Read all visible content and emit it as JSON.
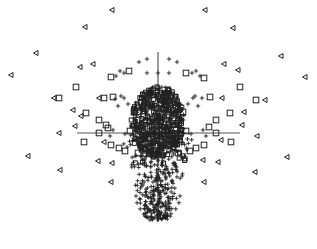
{
  "chart_data": {
    "type": "scatter",
    "title": "",
    "xlabel": "",
    "ylabel": "",
    "grid": false,
    "legend": null,
    "axes": {
      "style": "crosshair",
      "origin_px": [
        158,
        133
      ],
      "x_extent_px": [
        77,
        240
      ],
      "y_extent_px": [
        52,
        222
      ],
      "tick_labels": []
    },
    "colors": {
      "marker": "#222222",
      "axis": "#555555",
      "background": "#ffffff"
    },
    "series": [
      {
        "name": "triangles",
        "marker": "triangle-left-open",
        "points_px": [
          [
            112,
            10
          ],
          [
            205,
            10
          ],
          [
            85,
            27
          ],
          [
            233,
            28
          ],
          [
            36,
            53
          ],
          [
            281,
            56
          ],
          [
            11,
            75
          ],
          [
            305,
            77
          ],
          [
            80,
            67
          ],
          [
            93,
            64
          ],
          [
            224,
            64
          ],
          [
            238,
            70
          ],
          [
            54,
            98
          ],
          [
            99,
            98
          ],
          [
            222,
            98
          ],
          [
            265,
            100
          ],
          [
            73,
            110
          ],
          [
            81,
            116
          ],
          [
            244,
            112
          ],
          [
            75,
            126
          ],
          [
            242,
            125
          ],
          [
            59,
            133
          ],
          [
            257,
            136
          ],
          [
            104,
            142
          ],
          [
            221,
            140
          ],
          [
            28,
            156
          ],
          [
            98,
            161
          ],
          [
            112,
            163
          ],
          [
            203,
            160
          ],
          [
            218,
            162
          ],
          [
            287,
            157
          ],
          [
            60,
            170
          ],
          [
            255,
            172
          ],
          [
            111,
            182
          ],
          [
            204,
            182
          ]
        ]
      },
      {
        "name": "squares",
        "marker": "square-open",
        "points_px": [
          [
            129,
            71
          ],
          [
            111,
            77
          ],
          [
            186,
            73
          ],
          [
            204,
            78
          ],
          [
            76,
            87
          ],
          [
            240,
            87
          ],
          [
            59,
            98
          ],
          [
            104,
            98
          ],
          [
            113,
            97
          ],
          [
            210,
            97
          ],
          [
            256,
            100
          ],
          [
            86,
            113
          ],
          [
            230,
            113
          ],
          [
            99,
            120
          ],
          [
            216,
            120
          ],
          [
            106,
            125
          ],
          [
            108,
            128
          ],
          [
            209,
            127
          ],
          [
            99,
            133
          ],
          [
            216,
            133
          ],
          [
            84,
            142
          ],
          [
            231,
            142
          ],
          [
            111,
            145
          ],
          [
            204,
            145
          ],
          [
            119,
            148
          ],
          [
            196,
            148
          ],
          [
            125,
            151
          ],
          [
            190,
            151
          ],
          [
            138,
            153
          ],
          [
            178,
            153
          ],
          [
            134,
            112
          ],
          [
            183,
            112
          ],
          [
            138,
            120
          ],
          [
            179,
            120
          ],
          [
            145,
            95
          ],
          [
            171,
            95
          ],
          [
            151,
            104
          ],
          [
            165,
            104
          ],
          [
            130,
            131
          ],
          [
            186,
            131
          ],
          [
            140,
            140
          ],
          [
            176,
            140
          ]
        ]
      },
      {
        "name": "plus",
        "marker": "plus",
        "envelope": "dense elliptical core centered at (158,118) radius ~26x40 px, plus a downward-tapering fan to y~222 px and a sparse halo above the core",
        "points_px_sparse": [
          [
            147,
            59
          ],
          [
            169,
            59
          ],
          [
            139,
            62
          ],
          [
            177,
            62
          ],
          [
            120,
            71
          ],
          [
            147,
            73
          ],
          [
            158,
            73
          ],
          [
            169,
            73
          ],
          [
            196,
            71
          ],
          [
            116,
            76
          ],
          [
            200,
            76
          ],
          [
            124,
            73
          ],
          [
            192,
            73
          ],
          [
            115,
            99
          ],
          [
            124,
            98
          ],
          [
            202,
            98
          ],
          [
            193,
            98
          ],
          [
            118,
            106
          ],
          [
            198,
            106
          ],
          [
            121,
            96
          ],
          [
            195,
            96
          ],
          [
            128,
            104
          ],
          [
            188,
            104
          ],
          [
            113,
            130
          ],
          [
            203,
            130
          ],
          [
            110,
            136
          ],
          [
            206,
            136
          ],
          [
            125,
            134
          ],
          [
            191,
            134
          ]
        ]
      }
    ]
  }
}
